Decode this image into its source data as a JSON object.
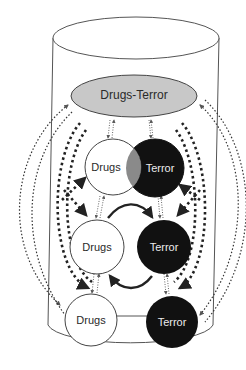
{
  "diagram": {
    "type": "cylinder-relationship-diagram",
    "colors": {
      "background": "#ffffff",
      "outline": "#555555",
      "top_node_fill": "#c8c8c8",
      "drugs_fill": "#ffffff",
      "terror_fill": "#111111",
      "overlap_fill": "#8a8a8a",
      "arrow": "#222222"
    },
    "top_node": {
      "label": "Drugs-Terror"
    },
    "rows": [
      {
        "drugs_label": "Drugs",
        "terror_label": "Terror",
        "relation": "overlapping"
      },
      {
        "drugs_label": "Drugs",
        "terror_label": "Terror",
        "relation": "cyclic-arrows"
      },
      {
        "drugs_label": "Drugs",
        "terror_label": "Terror",
        "relation": "separate"
      }
    ],
    "edges": [
      {
        "from": "Drugs-Terror",
        "to": "row1.Drugs",
        "style": "thin-dotted-bidirectional"
      },
      {
        "from": "Drugs-Terror",
        "to": "row1.Terror",
        "style": "thin-dotted-bidirectional"
      },
      {
        "from": "row1.Drugs",
        "to": "row2.Drugs",
        "style": "thin-dotted-bidirectional"
      },
      {
        "from": "row1.Terror",
        "to": "row2.Terror",
        "style": "thin-dotted-bidirectional"
      },
      {
        "from": "row2.Drugs",
        "to": "row3.Drugs",
        "style": "thin-dotted-bidirectional"
      },
      {
        "from": "row2.Terror",
        "to": "row3.Terror",
        "style": "thin-dotted-bidirectional"
      },
      {
        "from": "row2.Drugs",
        "to": "row2.Terror",
        "style": "solid-curved"
      },
      {
        "from": "row2.Terror",
        "to": "row2.Drugs",
        "style": "solid-curved"
      },
      {
        "from": "Drugs-Terror",
        "to": "row3.Drugs",
        "style": "outer-thin-dotted"
      },
      {
        "from": "Drugs-Terror",
        "to": "row3.Terror",
        "style": "outer-thin-dotted"
      },
      {
        "from": "row1",
        "to": "row3",
        "style": "thick-dashed-crossing"
      }
    ]
  }
}
